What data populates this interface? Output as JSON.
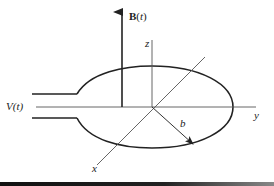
{
  "figure": {
    "labels": {
      "magnetic_field_bold": "B",
      "magnetic_field_arg": "(t)",
      "voltage": "V(t)",
      "z_axis": "z",
      "y_axis": "y",
      "x_axis": "x",
      "radius": "b"
    },
    "colors": {
      "stroke": "#222222",
      "axis": "#555555",
      "background": "#ffffff"
    }
  }
}
